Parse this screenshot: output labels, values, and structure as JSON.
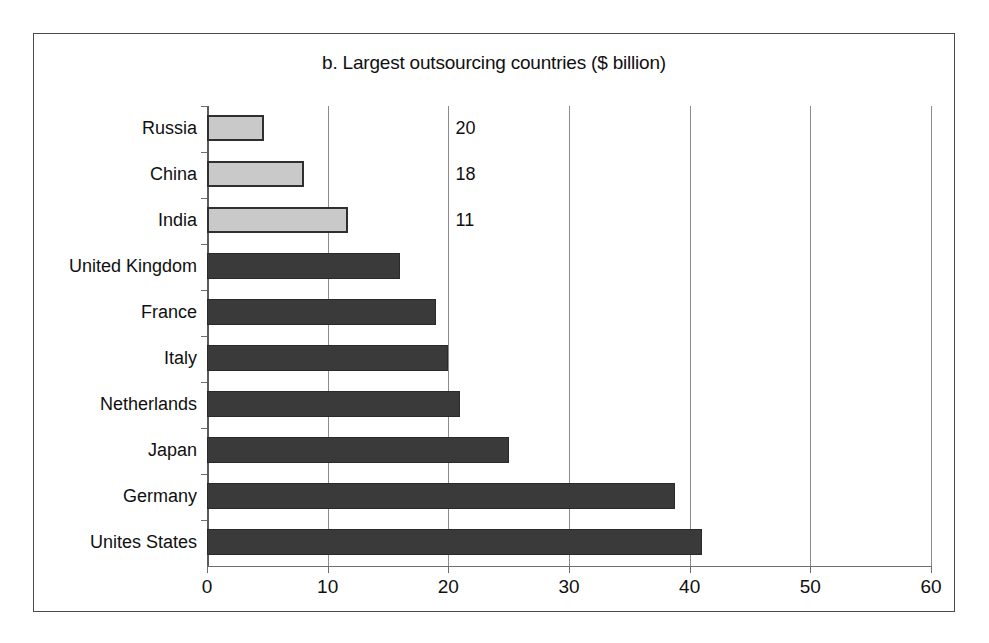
{
  "figure": {
    "panel_label": "b."
  },
  "chart_data": {
    "type": "bar",
    "orientation": "horizontal",
    "title": "b. Largest outsourcing countries ($ billion)",
    "xlabel": "",
    "ylabel": "",
    "xlim": [
      0,
      60
    ],
    "xticks": [
      0,
      10,
      20,
      30,
      40,
      50,
      60
    ],
    "xtick_labels": [
      "0",
      "10",
      "20",
      "30",
      "40",
      "50",
      "60"
    ],
    "grid": "vertical gridlines at each x tick",
    "legend": "none",
    "categories": [
      "Russia",
      "China",
      "India",
      "United Kingdom",
      "France",
      "Italy",
      "Netherlands",
      "Japan",
      "Germany",
      "Unites States"
    ],
    "values": [
      4.7,
      8,
      11.7,
      16,
      19,
      20,
      21,
      25,
      38.8,
      41
    ],
    "bar_styles": [
      "light",
      "light",
      "light",
      "dark",
      "dark",
      "dark",
      "dark",
      "dark",
      "dark",
      "dark"
    ],
    "annotations": [
      {
        "text": "20",
        "category": "Russia",
        "x": 20.6
      },
      {
        "text": "18",
        "category": "China",
        "x": 20.6
      },
      {
        "text": "11",
        "category": "India",
        "x": 20.6
      }
    ],
    "colors": {
      "bar_light_fill": "#c9c9c9",
      "bar_light_edge": "#2f2f2f",
      "bar_dark_fill": "#3a3a3a",
      "bar_dark_edge": "#2a2a2a",
      "gridline": "#8c8c8c",
      "axis": "#5a5a5a",
      "background": "#ffffff",
      "text": "#101010"
    }
  }
}
